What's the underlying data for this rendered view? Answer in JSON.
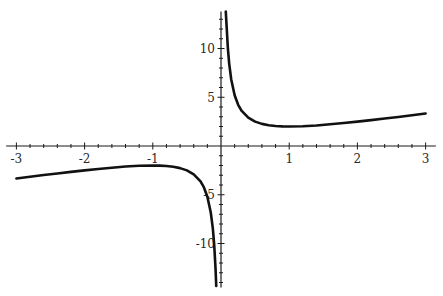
{
  "chart_data": {
    "type": "line",
    "title": "",
    "xlabel": "",
    "ylabel": "",
    "function": "y = x + 1/x",
    "xlim": [
      -3.15,
      3.15
    ],
    "ylim": [
      -14.5,
      13.8
    ],
    "grid": false,
    "legend": null,
    "x_ticks": [
      {
        "value": -3,
        "label": "-3"
      },
      {
        "value": -2,
        "label": "-2"
      },
      {
        "value": -1,
        "label": "-1"
      },
      {
        "value": 1,
        "label": "1"
      },
      {
        "value": 2,
        "label": "2"
      },
      {
        "value": 3,
        "label": "3"
      }
    ],
    "y_ticks": [
      {
        "value": 10,
        "label": "10"
      },
      {
        "value": 5,
        "label": "5"
      },
      {
        "value": -5,
        "label": "-5"
      },
      {
        "value": -10,
        "label": "-10"
      }
    ],
    "x_minor_step": 0.2,
    "y_minor_step": 1,
    "series": [
      {
        "name": "right-branch",
        "x": [
          0.07,
          0.08,
          0.1,
          0.12,
          0.15,
          0.2,
          0.25,
          0.3,
          0.4,
          0.5,
          0.6,
          0.7,
          0.8,
          0.9,
          1.0,
          1.2,
          1.4,
          1.6,
          1.8,
          2.0,
          2.2,
          2.4,
          2.6,
          2.8,
          3.0
        ],
        "y": [
          14.36,
          12.58,
          10.1,
          8.45,
          6.82,
          5.2,
          4.25,
          3.63,
          2.9,
          2.5,
          2.27,
          2.13,
          2.05,
          2.01,
          2.0,
          2.03,
          2.11,
          2.23,
          2.36,
          2.5,
          2.65,
          2.82,
          2.98,
          3.16,
          3.33
        ]
      },
      {
        "name": "left-branch",
        "x": [
          -3.0,
          -2.8,
          -2.6,
          -2.4,
          -2.2,
          -2.0,
          -1.8,
          -1.6,
          -1.4,
          -1.2,
          -1.0,
          -0.9,
          -0.8,
          -0.7,
          -0.6,
          -0.5,
          -0.4,
          -0.3,
          -0.25,
          -0.2,
          -0.15,
          -0.12,
          -0.1,
          -0.08,
          -0.07
        ],
        "y": [
          -3.33,
          -3.16,
          -2.98,
          -2.82,
          -2.65,
          -2.5,
          -2.36,
          -2.23,
          -2.11,
          -2.03,
          -2.0,
          -2.01,
          -2.05,
          -2.13,
          -2.27,
          -2.5,
          -2.9,
          -3.63,
          -4.25,
          -5.2,
          -6.82,
          -8.45,
          -10.1,
          -12.58,
          -14.36
        ]
      }
    ]
  }
}
